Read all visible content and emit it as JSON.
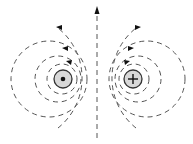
{
  "diagram": {
    "wires": [
      {
        "id": "left",
        "symbol": "dot",
        "meaning": "current out of page",
        "cx": 63,
        "cy": 79,
        "r": 9
      },
      {
        "id": "right",
        "symbol": "cross",
        "meaning": "current into page",
        "cx": 133,
        "cy": 79,
        "r": 9
      }
    ],
    "center_line": {
      "x": 97,
      "y_top": 8,
      "y_bottom": 138,
      "arrow": "up"
    },
    "colors": {
      "wire_fill": "#d8d8d8",
      "line": "#555555",
      "arrow": "#111111"
    }
  }
}
